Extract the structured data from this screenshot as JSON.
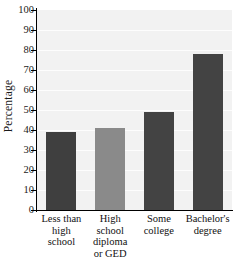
{
  "chart_data": {
    "type": "bar",
    "title": "",
    "xlabel": "",
    "ylabel": "Percentage",
    "ylim": [
      0,
      100
    ],
    "grid": true,
    "legend": "none",
    "categories": [
      "Less than high school",
      "High school diploma or GED",
      "Some college",
      "Bachelor's degree"
    ],
    "category_lines": [
      [
        "Less than",
        "high",
        "school"
      ],
      [
        "High",
        "school",
        "diploma",
        "or GED"
      ],
      [
        "Some",
        "college"
      ],
      [
        "Bachelor's",
        "degree"
      ]
    ],
    "values": [
      39,
      41,
      49,
      78
    ],
    "bar_colors": [
      "#3f3f3f",
      "#8a8a8a",
      "#434343",
      "#434343"
    ],
    "ytick_labels": [
      "100",
      "90",
      "80",
      "70",
      "60",
      "50",
      "40",
      "30",
      "20",
      "10",
      "0"
    ],
    "ytick_values": [
      100,
      90,
      80,
      70,
      60,
      50,
      40,
      30,
      20,
      10,
      0
    ],
    "plot_background": "#f2f2f2",
    "gridline_color": "#ffffff",
    "axis_color": "#000000"
  }
}
